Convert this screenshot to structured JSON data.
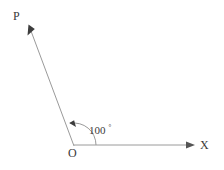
{
  "figure": {
    "type": "geometry-angle-diagram",
    "background_color": "#ffffff",
    "stroke_color": "#9a9a9a",
    "text_color": "#3a3a3a",
    "labels": {
      "ray_endpoint": "P",
      "axis_endpoint": "X",
      "vertex": "O"
    },
    "angle": {
      "value": "100",
      "degree_symbol": "°",
      "measure_degrees": 100,
      "vertex_x": 74,
      "vertex_y": 146,
      "arc_radius": 22
    },
    "rays": [
      {
        "name": "ray-op",
        "from_label": "O",
        "to_label": "P",
        "start_x": 74,
        "start_y": 146,
        "end_x": 29,
        "end_y": 27,
        "arrowhead": "true"
      },
      {
        "name": "ray-ox",
        "from_label": "O",
        "to_label": "X",
        "start_x": 74,
        "start_y": 145,
        "end_x": 195,
        "end_y": 145,
        "arrowhead": "true"
      }
    ]
  }
}
